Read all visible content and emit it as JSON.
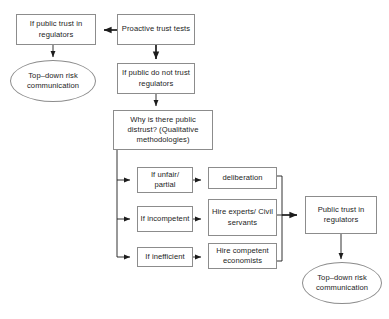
{
  "diagram": {
    "type": "flowchart",
    "colors": {
      "background": "#ffffff",
      "stroke": "#8c8c8c",
      "arrow": "#1c1c1c",
      "text": "#1c1c1c"
    },
    "nodes": [
      {
        "id": "if-public-trust",
        "shape": "box",
        "label": "If public trust in regulators",
        "x": 16,
        "y": 14,
        "w": 80,
        "h": 31
      },
      {
        "id": "proactive-trust-tests",
        "shape": "box",
        "label": "Proactive trust tests",
        "x": 117,
        "y": 14,
        "w": 78,
        "h": 31
      },
      {
        "id": "top-down-risk-left",
        "shape": "ellipse",
        "label": "Top–down risk communication",
        "x": 10,
        "y": 60,
        "w": 86,
        "h": 42
      },
      {
        "id": "if-public-do-not-trust",
        "shape": "box",
        "label": "If public do not trust regulators",
        "x": 117,
        "y": 63,
        "w": 78,
        "h": 31
      },
      {
        "id": "why-distrust",
        "shape": "box",
        "label": "Why is there public distrust? (Qualitative methodologies)",
        "x": 113,
        "y": 110,
        "w": 100,
        "h": 40
      },
      {
        "id": "if-unfair-partial",
        "shape": "box",
        "label": "If unfair/ partial",
        "x": 137,
        "y": 167,
        "w": 56,
        "h": 26
      },
      {
        "id": "deliberation",
        "shape": "box",
        "label": "deliberation",
        "x": 208,
        "y": 167,
        "w": 69,
        "h": 22
      },
      {
        "id": "if-incompetent",
        "shape": "box",
        "label": "If incompetent",
        "x": 137,
        "y": 206,
        "w": 56,
        "h": 26
      },
      {
        "id": "hire-experts",
        "shape": "box",
        "label": "Hire experts/ Civil servants",
        "x": 208,
        "y": 199,
        "w": 69,
        "h": 37
      },
      {
        "id": "if-inefficient",
        "shape": "box",
        "label": "If inefficient",
        "x": 137,
        "y": 247,
        "w": 56,
        "h": 20
      },
      {
        "id": "hire-economists",
        "shape": "box",
        "label": "Hire competent economists",
        "x": 208,
        "y": 243,
        "w": 69,
        "h": 26
      },
      {
        "id": "public-trust-regulators",
        "shape": "box",
        "label": "Public trust in regulators",
        "x": 305,
        "y": 196,
        "w": 72,
        "h": 38
      },
      {
        "id": "top-down-risk-right",
        "shape": "ellipse",
        "label": "Top–down risk communication",
        "x": 302,
        "y": 262,
        "w": 80,
        "h": 42
      }
    ],
    "edges": [
      {
        "from": "proactive-trust-tests",
        "to": "if-public-trust",
        "style": "bold-arrow"
      },
      {
        "from": "if-public-trust",
        "to": "top-down-risk-left",
        "style": "arrow"
      },
      {
        "from": "proactive-trust-tests",
        "to": "if-public-do-not-trust",
        "style": "bold-arrow"
      },
      {
        "from": "if-public-do-not-trust",
        "to": "why-distrust",
        "style": "arrow"
      },
      {
        "from": "why-distrust",
        "to": "if-unfair-partial",
        "style": "elbow-arrow"
      },
      {
        "from": "why-distrust",
        "to": "if-incompetent",
        "style": "elbow-arrow"
      },
      {
        "from": "why-distrust",
        "to": "if-inefficient",
        "style": "elbow-arrow"
      },
      {
        "from": "if-unfair-partial",
        "to": "deliberation",
        "style": "arrow"
      },
      {
        "from": "if-incompetent",
        "to": "hire-experts",
        "style": "arrow"
      },
      {
        "from": "if-inefficient",
        "to": "hire-economists",
        "style": "arrow"
      },
      {
        "from": "deliberation",
        "to": "public-trust-regulators",
        "style": "merge-rail"
      },
      {
        "from": "hire-experts",
        "to": "public-trust-regulators",
        "style": "merge-rail-bold"
      },
      {
        "from": "hire-economists",
        "to": "public-trust-regulators",
        "style": "merge-rail"
      },
      {
        "from": "public-trust-regulators",
        "to": "top-down-risk-right",
        "style": "arrow"
      }
    ]
  }
}
